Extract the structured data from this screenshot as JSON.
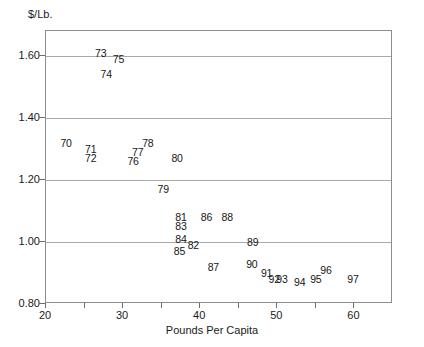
{
  "chart_data": {
    "type": "scatter",
    "title": "",
    "xlabel": "Pounds Per Capita",
    "ylabel": "$/Lb.",
    "xlim": [
      20,
      65
    ],
    "ylim": [
      0.8,
      1.68
    ],
    "grid": true,
    "legend": "none",
    "point_style": "year-number-label",
    "x_ticks": [
      {
        "value": 20,
        "label": "20",
        "major": true
      },
      {
        "value": 25,
        "label": "",
        "major": false
      },
      {
        "value": 30,
        "label": "30",
        "major": true
      },
      {
        "value": 35,
        "label": "",
        "major": false
      },
      {
        "value": 40,
        "label": "40",
        "major": true
      },
      {
        "value": 45,
        "label": "",
        "major": false
      },
      {
        "value": 50,
        "label": "50",
        "major": true
      },
      {
        "value": 55,
        "label": "",
        "major": false
      },
      {
        "value": 60,
        "label": "60",
        "major": true
      }
    ],
    "y_ticks": [
      {
        "value": 0.8,
        "label": "0.80"
      },
      {
        "value": 1.0,
        "label": "1.00"
      },
      {
        "value": 1.2,
        "label": "1.20"
      },
      {
        "value": 1.4,
        "label": "1.40"
      },
      {
        "value": 1.6,
        "label": "1.60"
      }
    ],
    "gridlines_y": [
      1.0,
      1.2,
      1.4,
      1.6
    ],
    "points": [
      {
        "label": "70",
        "x": 22.6,
        "y": 1.32
      },
      {
        "label": "71",
        "x": 25.8,
        "y": 1.3
      },
      {
        "label": "72",
        "x": 25.8,
        "y": 1.27
      },
      {
        "label": "73",
        "x": 27.1,
        "y": 1.61
      },
      {
        "label": "74",
        "x": 27.8,
        "y": 1.54
      },
      {
        "label": "75",
        "x": 29.4,
        "y": 1.59
      },
      {
        "label": "76",
        "x": 31.3,
        "y": 1.26
      },
      {
        "label": "77",
        "x": 31.9,
        "y": 1.29
      },
      {
        "label": "78",
        "x": 33.2,
        "y": 1.32
      },
      {
        "label": "79",
        "x": 35.2,
        "y": 1.17
      },
      {
        "label": "80",
        "x": 37.0,
        "y": 1.27
      },
      {
        "label": "81",
        "x": 37.5,
        "y": 1.08
      },
      {
        "label": "82",
        "x": 39.1,
        "y": 0.99
      },
      {
        "label": "83",
        "x": 37.5,
        "y": 1.05
      },
      {
        "label": "84",
        "x": 37.5,
        "y": 1.01
      },
      {
        "label": "85",
        "x": 37.3,
        "y": 0.97
      },
      {
        "label": "86",
        "x": 40.8,
        "y": 1.08
      },
      {
        "label": "87",
        "x": 41.7,
        "y": 0.92
      },
      {
        "label": "88",
        "x": 43.5,
        "y": 1.08
      },
      {
        "label": "89",
        "x": 46.8,
        "y": 1.0
      },
      {
        "label": "90",
        "x": 46.7,
        "y": 0.93
      },
      {
        "label": "91",
        "x": 48.6,
        "y": 0.9
      },
      {
        "label": "92",
        "x": 49.6,
        "y": 0.88
      },
      {
        "label": "93",
        "x": 50.6,
        "y": 0.88
      },
      {
        "label": "94",
        "x": 52.9,
        "y": 0.87
      },
      {
        "label": "95",
        "x": 55.0,
        "y": 0.88
      },
      {
        "label": "96",
        "x": 56.3,
        "y": 0.91
      },
      {
        "label": "97",
        "x": 59.8,
        "y": 0.88
      }
    ]
  }
}
